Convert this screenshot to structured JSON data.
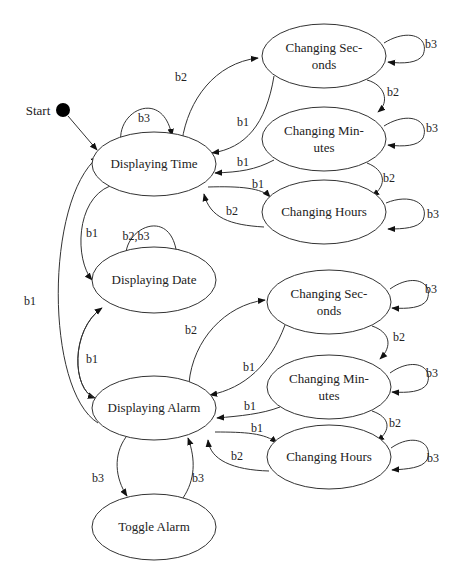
{
  "diagram": {
    "type": "state-machine",
    "start": {
      "label": "Start",
      "x": 63,
      "y": 110,
      "r": 7,
      "label_x": 38,
      "label_y": 115
    },
    "nodes": [
      {
        "id": "displaying_time",
        "lines": [
          "Displaying Time"
        ],
        "cx": 154,
        "cy": 164,
        "rx": 62,
        "ry": 32
      },
      {
        "id": "displaying_date",
        "lines": [
          "Displaying Date"
        ],
        "cx": 154,
        "cy": 280,
        "rx": 62,
        "ry": 33
      },
      {
        "id": "displaying_alarm",
        "lines": [
          "Displaying Alarm"
        ],
        "cx": 154,
        "cy": 408,
        "rx": 62,
        "ry": 32
      },
      {
        "id": "toggle_alarm",
        "lines": [
          "Toggle Alarm"
        ],
        "cx": 154,
        "cy": 527,
        "rx": 62,
        "ry": 33
      },
      {
        "id": "time_changing_seconds",
        "lines": [
          "Changing Sec-",
          "onds"
        ],
        "cx": 324,
        "cy": 56,
        "rx": 62,
        "ry": 32
      },
      {
        "id": "time_changing_minutes",
        "lines": [
          "Changing Min-",
          "utes"
        ],
        "cx": 324,
        "cy": 139,
        "rx": 62,
        "ry": 32
      },
      {
        "id": "time_changing_hours",
        "lines": [
          "Changing Hours"
        ],
        "cx": 324,
        "cy": 212,
        "rx": 62,
        "ry": 32
      },
      {
        "id": "alarm_changing_seconds",
        "lines": [
          "Changing Sec-",
          "onds"
        ],
        "cx": 329,
        "cy": 302,
        "rx": 62,
        "ry": 32
      },
      {
        "id": "alarm_changing_minutes",
        "lines": [
          "Changing Min-",
          "utes"
        ],
        "cx": 329,
        "cy": 387,
        "rx": 62,
        "ry": 32
      },
      {
        "id": "alarm_changing_hours",
        "lines": [
          "Changing Hours"
        ],
        "cx": 329,
        "cy": 457,
        "rx": 62,
        "ry": 32
      }
    ],
    "edges": [
      {
        "from": "start",
        "to": "displaying_time",
        "label": "",
        "d": "M68,116 L97,150",
        "label_x": 0,
        "label_y": 0
      },
      {
        "from": "displaying_time",
        "to": "displaying_time",
        "label": "b3",
        "d": "M121,143 C116,110 163,88 172,136",
        "label_x": 144,
        "label_y": 122
      },
      {
        "from": "displaying_time",
        "to": "time_changing_seconds",
        "label": "b2",
        "d": "M182,141 C188,100 215,63 258,58",
        "label_x": 181,
        "label_y": 81
      },
      {
        "from": "time_changing_seconds",
        "to": "displaying_time",
        "label": "b1",
        "d": "M274,76 C266,125 245,148 212,153",
        "label_x": 243,
        "label_y": 126
      },
      {
        "from": "time_changing_minutes",
        "to": "displaying_time",
        "label": "b1",
        "d": "M274,160 C255,170 240,172 215,173",
        "label_x": 243,
        "label_y": 166
      },
      {
        "from": "displaying_time",
        "to": "time_changing_hours",
        "label": "b1",
        "d": "M208,187 C240,186 262,188 270,197",
        "label_x": 258,
        "label_y": 188
      },
      {
        "from": "time_changing_hours",
        "to": "displaying_time",
        "label": "b2",
        "d": "M264,227 C230,225 210,218 204,194",
        "label_x": 232,
        "label_y": 215
      },
      {
        "from": "time_changing_seconds",
        "to": "time_changing_seconds",
        "label": "b3",
        "d": "M384,43 C410,27 430,38 423,55 C418,63 404,64 388,62",
        "label_x": 431,
        "label_y": 48
      },
      {
        "from": "time_changing_seconds",
        "to": "time_changing_minutes",
        "label": "b2",
        "d": "M367,80 C385,85 390,102 378,112",
        "label_x": 393,
        "label_y": 96
      },
      {
        "from": "time_changing_minutes",
        "to": "time_changing_minutes",
        "label": "b3",
        "d": "M384,126 C410,110 430,121 423,138 C418,146 404,147 388,145",
        "label_x": 432,
        "label_y": 132
      },
      {
        "from": "time_changing_minutes",
        "to": "time_changing_hours",
        "label": "b2",
        "d": "M367,163 C385,170 388,185 372,196",
        "label_x": 389,
        "label_y": 182
      },
      {
        "from": "time_changing_hours",
        "to": "time_changing_hours",
        "label": "b3",
        "d": "M386,203 C410,193 430,203 423,220 C418,228 404,229 388,229",
        "label_x": 433,
        "label_y": 218
      },
      {
        "from": "displaying_time",
        "to": "displaying_date",
        "label": "b1",
        "d": "M110,186 C75,200 75,260 92,280",
        "label_x": 92,
        "label_y": 237
      },
      {
        "from": "displaying_date",
        "to": "displaying_date",
        "label": "b2,b3",
        "d": "M126,258 C123,228 172,205 177,256",
        "label_x": 136,
        "label_y": 240
      },
      {
        "from": "displaying_date",
        "to": "displaying_alarm",
        "label": "b1",
        "d": "M102,308 C70,330 72,390 95,398",
        "label_x": 92,
        "label_y": 363
      },
      {
        "from": "displaying_alarm",
        "to": "displaying_date",
        "label": "",
        "d": "M95,398 C72,390 70,330 102,308",
        "label_x": 0,
        "label_y": 0
      },
      {
        "from": "displaying_alarm",
        "to": "displaying_time",
        "label": "b1",
        "d": "M98,423 C45,390 45,200 98,157",
        "label_x": 30,
        "label_y": 305
      },
      {
        "from": "displaying_alarm",
        "to": "alarm_changing_seconds",
        "label": "b2",
        "d": "M189,383 C193,340 225,305 265,300",
        "label_x": 191,
        "label_y": 334
      },
      {
        "from": "alarm_changing_seconds",
        "to": "displaying_alarm",
        "label": "b1",
        "d": "M285,325 C270,365 245,388 210,395",
        "label_x": 249,
        "label_y": 371
      },
      {
        "from": "alarm_changing_minutes",
        "to": "displaying_alarm",
        "label": "b1",
        "d": "M280,407 C262,414 240,416 217,418",
        "label_x": 250,
        "label_y": 410
      },
      {
        "from": "displaying_alarm",
        "to": "alarm_changing_hours",
        "label": "b1",
        "d": "M215,432 C245,432 265,433 277,443",
        "label_x": 257,
        "label_y": 432
      },
      {
        "from": "alarm_changing_hours",
        "to": "displaying_alarm",
        "label": "b2",
        "d": "M269,471 C233,470 210,460 208,440",
        "label_x": 237,
        "label_y": 460
      },
      {
        "from": "alarm_changing_seconds",
        "to": "alarm_changing_seconds",
        "label": "b3",
        "d": "M390,289 C414,272 434,283 427,300 C422,308 408,309 392,308",
        "label_x": 431,
        "label_y": 293
      },
      {
        "from": "alarm_changing_seconds",
        "to": "alarm_changing_minutes",
        "label": "b2",
        "d": "M372,326 C390,332 393,346 380,359",
        "label_x": 399,
        "label_y": 341
      },
      {
        "from": "alarm_changing_minutes",
        "to": "alarm_changing_minutes",
        "label": "b3",
        "d": "M390,373 C414,356 434,367 427,384 C422,392 408,393 392,392",
        "label_x": 432,
        "label_y": 377
      },
      {
        "from": "alarm_changing_minutes",
        "to": "alarm_changing_hours",
        "label": "b2",
        "d": "M372,411 C390,417 392,430 377,441",
        "label_x": 395,
        "label_y": 427
      },
      {
        "from": "alarm_changing_hours",
        "to": "alarm_changing_hours",
        "label": "b3",
        "d": "M391,448 C414,432 434,443 427,460 C422,468 408,469 392,470",
        "label_x": 433,
        "label_y": 462
      },
      {
        "from": "displaying_alarm",
        "to": "toggle_alarm",
        "label": "b3",
        "d": "M126,437 C113,455 115,478 127,496",
        "label_x": 98,
        "label_y": 482
      },
      {
        "from": "toggle_alarm",
        "to": "displaying_alarm",
        "label": "b3",
        "d": "M183,498 C195,480 196,460 188,438",
        "label_x": 198,
        "label_y": 482
      }
    ]
  }
}
